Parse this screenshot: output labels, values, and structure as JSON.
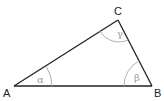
{
  "diagram": {
    "type": "triangle",
    "colors": {
      "edge": "#222222",
      "arc": "#b0b0b0",
      "vertex_label": "#222222",
      "angle_label": "#9a9a9a"
    },
    "vertices": [
      {
        "id": "A",
        "label": "A",
        "x": 14,
        "y": 86
      },
      {
        "id": "B",
        "label": "B",
        "x": 152,
        "y": 86
      },
      {
        "id": "C",
        "label": "C",
        "x": 118,
        "y": 20
      }
    ],
    "angles": [
      {
        "at": "A",
        "label": "α"
      },
      {
        "at": "B",
        "label": "β"
      },
      {
        "at": "C",
        "label": "γ"
      }
    ]
  }
}
